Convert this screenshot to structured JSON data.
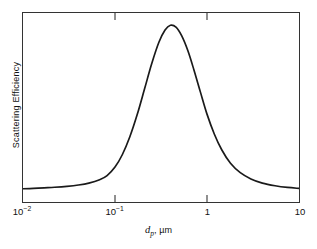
{
  "chart_data": {
    "type": "line",
    "title": "",
    "xlabel": "d_p, µm",
    "ylabel": "Scattering Efficiency",
    "xscale": "log",
    "yscale": "linear",
    "xlim": [
      0.01,
      10
    ],
    "ylim": [
      0,
      1
    ],
    "grid": false,
    "legend": null,
    "xticks": [
      0.01,
      0.1,
      1,
      10
    ],
    "xticklabels": [
      "10⁻²",
      "10⁻¹",
      "1",
      "10"
    ],
    "yticks": [],
    "yticklabels": [],
    "series": [
      {
        "name": "Scattering Efficiency",
        "x": [
          0.01,
          0.013,
          0.017,
          0.022,
          0.03,
          0.04,
          0.052,
          0.068,
          0.082,
          0.1,
          0.12,
          0.145,
          0.175,
          0.21,
          0.25,
          0.3,
          0.35,
          0.4,
          0.46,
          0.53,
          0.62,
          0.72,
          0.85,
          1.0,
          1.2,
          1.45,
          1.8,
          2.3,
          3.0,
          4.0,
          5.5,
          7.5,
          10.0
        ],
        "y": [
          0.07,
          0.072,
          0.075,
          0.078,
          0.083,
          0.09,
          0.1,
          0.118,
          0.14,
          0.185,
          0.25,
          0.345,
          0.465,
          0.6,
          0.73,
          0.845,
          0.91,
          0.935,
          0.925,
          0.88,
          0.8,
          0.7,
          0.58,
          0.465,
          0.36,
          0.275,
          0.205,
          0.155,
          0.122,
          0.1,
          0.086,
          0.077,
          0.072
        ]
      }
    ],
    "peak": {
      "x": 0.4,
      "y": 0.935
    },
    "line_color": "#1a1a1a",
    "line_width": 1.6,
    "frame_color": "#333333",
    "background_color": "#ffffff"
  },
  "axes": {
    "x_tick_labels": [
      {
        "text": "10",
        "exp": "−2",
        "pos_pct": 0.0
      },
      {
        "text": "10",
        "exp": "−1",
        "pos_pct": 33.333
      },
      {
        "text": "1",
        "exp": "",
        "pos_pct": 66.667
      },
      {
        "text": "10",
        "exp": "",
        "pos_pct": 100.0
      }
    ],
    "x_title_symbol": "d",
    "x_title_subscript": "p",
    "x_title_separator": ", ",
    "x_title_unit": "µm",
    "y_title": "Scattering Efficiency"
  }
}
